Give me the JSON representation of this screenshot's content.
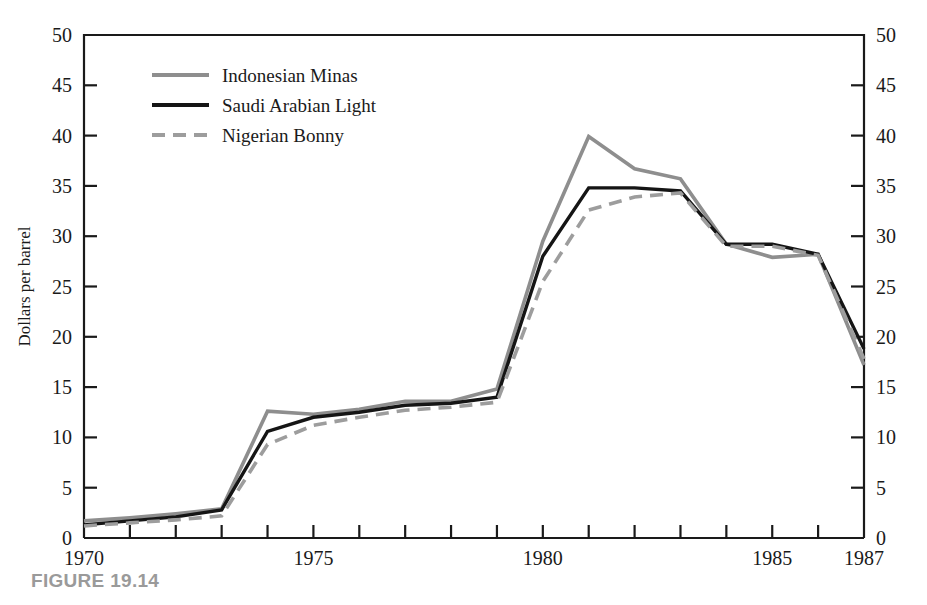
{
  "figure": {
    "caption": "FIGURE 19.14"
  },
  "chart_data": {
    "type": "line",
    "title": "",
    "xlabel": "",
    "ylabel": "Dollars per barrel",
    "xlim": [
      1970,
      1987
    ],
    "ylim": [
      0,
      50
    ],
    "grid": false,
    "legend_position": "top-left",
    "x": [
      1970,
      1971,
      1972,
      1973,
      1974,
      1975,
      1976,
      1977,
      1978,
      1979,
      1980,
      1981,
      1982,
      1983,
      1984,
      1985,
      1986,
      1987
    ],
    "xticks": [
      1970,
      1971,
      1972,
      1973,
      1974,
      1975,
      1976,
      1977,
      1978,
      1979,
      1980,
      1981,
      1982,
      1983,
      1984,
      1985,
      1986,
      1987
    ],
    "xtick_labels": [
      "1970",
      "",
      "",
      "",
      "",
      "1975",
      "",
      "",
      "",
      "",
      "1980",
      "",
      "",
      "",
      "",
      "1985",
      "",
      "1987"
    ],
    "yticks": [
      0,
      5,
      10,
      15,
      20,
      25,
      30,
      35,
      40,
      45,
      50
    ],
    "ytick_labels": [
      "0",
      "5",
      "10",
      "15",
      "20",
      "25",
      "30",
      "35",
      "40",
      "45",
      "50"
    ],
    "right_axis_ticks": [
      0,
      5,
      10,
      15,
      20,
      25,
      30,
      35,
      40,
      45,
      50
    ],
    "right_axis_tick_labels": [
      "0",
      "5",
      "10",
      "15",
      "20",
      "25",
      "30",
      "35",
      "40",
      "45",
      "50"
    ],
    "series": [
      {
        "name": "Indonesian Minas",
        "style": "solid",
        "color": "#8e8e8e",
        "width": 3.6,
        "values": [
          1.7,
          2.0,
          2.4,
          2.9,
          12.6,
          12.3,
          12.8,
          13.6,
          13.6,
          14.8,
          29.5,
          39.9,
          36.7,
          35.7,
          29.2,
          27.9,
          28.2,
          17.2
        ]
      },
      {
        "name": "Saudi Arabian Light",
        "style": "solid",
        "color": "#151515",
        "width": 3.4,
        "values": [
          1.3,
          1.7,
          2.1,
          2.8,
          10.6,
          12.0,
          12.5,
          13.2,
          13.4,
          14.0,
          28.0,
          34.8,
          34.8,
          34.5,
          29.2,
          29.2,
          28.2,
          18.8
        ]
      },
      {
        "name": "Nigerian Bonny",
        "style": "dashed",
        "color": "#9d9d9d",
        "width": 3.6,
        "values": [
          1.2,
          1.5,
          1.8,
          2.2,
          9.3,
          11.2,
          12.0,
          12.7,
          13.0,
          13.5,
          25.5,
          32.6,
          33.9,
          34.3,
          29.0,
          29.0,
          28.1,
          17.8
        ]
      }
    ]
  },
  "legend": {
    "items": [
      {
        "label": "Indonesian Minas",
        "swatch": "gray-solid-line"
      },
      {
        "label": "Saudi Arabian Light",
        "swatch": "black-solid-line"
      },
      {
        "label": "Nigerian Bonny",
        "swatch": "gray-dashed-line"
      }
    ]
  },
  "axes": {
    "left_title": "Dollars per barrel"
  }
}
